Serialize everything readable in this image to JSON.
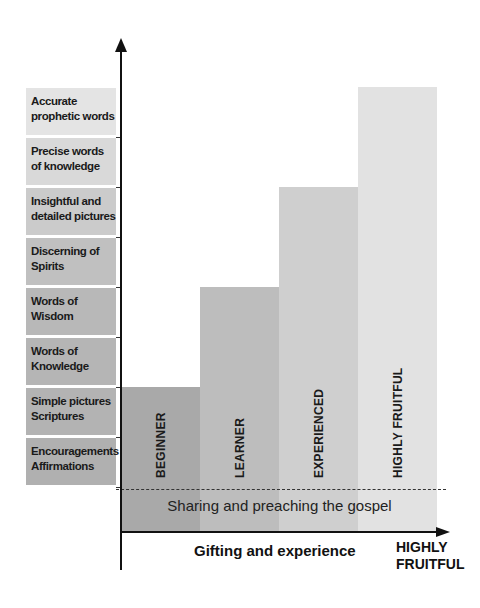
{
  "y_axis": {
    "levels": [
      {
        "label_line1": "Accurate",
        "label_line2": "prophetic words",
        "color": "#e4e4e4"
      },
      {
        "label_line1": "Precise words",
        "label_line2": "of knowledge",
        "color": "#d9d9d9"
      },
      {
        "label_line1": "Insightful and",
        "label_line2": "detailed pictures",
        "color": "#cbcbcb"
      },
      {
        "label_line1": "Discerning of",
        "label_line2": "Spirits",
        "color": "#c0c0c0"
      },
      {
        "label_line1": "Words of",
        "label_line2": "Wisdom",
        "color": "#b8b8b8"
      },
      {
        "label_line1": "Words of",
        "label_line2": "Knowledge",
        "color": "#b5b5b5"
      },
      {
        "label_line1": "Simple pictures",
        "label_line2": "Scriptures",
        "color": "#b3b3b3"
      },
      {
        "label_line1": "Encouragements",
        "label_line2": "Affirmations",
        "color": "#b0b0b0"
      }
    ]
  },
  "chart_data": {
    "type": "bar",
    "title": "",
    "xlabel": "Gifting and experience",
    "x_end_label_line1": "HIGHLY",
    "x_end_label_line2": "FRUITFUL",
    "categories": [
      "BEGINNER",
      "LEARNER",
      "EXPERIENCED",
      "HIGHLY FRUITFUL"
    ],
    "values": [
      2,
      4,
      6,
      8
    ],
    "units": "levels of gifting reached (out of 8)",
    "ylim": [
      0,
      8
    ],
    "colors": [
      "#a9a9a9",
      "#bdbdbd",
      "#cfcfcf",
      "#e2e2e2"
    ],
    "base_band_label": "Sharing and preaching the gospel",
    "grid": false
  }
}
